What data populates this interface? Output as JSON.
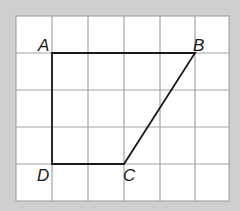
{
  "figure": {
    "type": "quadrilateral-on-grid",
    "grid": {
      "columns": 6,
      "rows": 5,
      "origin_px": [
        16,
        16
      ],
      "cell_px": [
        35.5,
        37
      ],
      "line_color": "#9a9a9a",
      "fill_color": "#ffffff",
      "background_color": "#cfcfcf"
    },
    "shape": {
      "stroke_color": "#1a1a1a",
      "vertices": [
        {
          "label": "A",
          "grid": [
            1,
            1
          ]
        },
        {
          "label": "B",
          "grid": [
            5,
            1
          ]
        },
        {
          "label": "C",
          "grid": [
            3,
            4
          ]
        },
        {
          "label": "D",
          "grid": [
            1,
            4
          ]
        }
      ]
    },
    "labels": {
      "A": "A",
      "B": "B",
      "C": "C",
      "D": "D"
    }
  }
}
